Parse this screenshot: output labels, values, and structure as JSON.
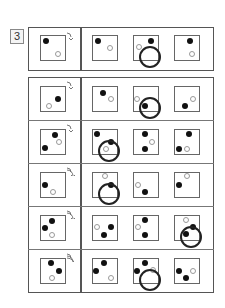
{
  "question_number": "3",
  "cell_size": 26,
  "example": {
    "rotation_arcs": 1,
    "given": {
      "dots": [
        {
          "x": 5,
          "y": 5,
          "type": "filled"
        },
        {
          "x": 17,
          "y": 18,
          "type": "hollow"
        }
      ]
    },
    "options": [
      {
        "dots": [
          {
            "x": 5,
            "y": 5,
            "type": "filled"
          },
          {
            "x": 17,
            "y": 12,
            "type": "hollow"
          }
        ],
        "circled": false
      },
      {
        "dots": [
          {
            "x": 17,
            "y": 5,
            "type": "filled"
          },
          {
            "x": 5,
            "y": 11,
            "type": "hollow"
          }
        ],
        "circled": true
      },
      {
        "dots": [
          {
            "x": 15,
            "y": 5,
            "type": "filled"
          },
          {
            "x": 17,
            "y": 18,
            "type": "hollow"
          }
        ],
        "circled": false
      }
    ]
  },
  "rows": [
    {
      "rotation_arcs": 1,
      "given": {
        "dots": [
          {
            "x": 17,
            "y": 12,
            "type": "filled"
          },
          {
            "x": 8,
            "y": 19,
            "type": "hollow"
          }
        ]
      },
      "options": [
        {
          "dots": [
            {
              "x": 10,
              "y": 6,
              "type": "filled"
            },
            {
              "x": 18,
              "y": 12,
              "type": "hollow"
            }
          ],
          "circled": false
        },
        {
          "dots": [
            {
              "x": 11,
              "y": 19,
              "type": "filled"
            },
            {
              "x": 3,
              "y": 12,
              "type": "hollow"
            }
          ],
          "circled": true
        },
        {
          "dots": [
            {
              "x": 10,
              "y": 19,
              "type": "filled"
            },
            {
              "x": 18,
              "y": 12,
              "type": "hollow"
            }
          ],
          "circled": false
        }
      ]
    },
    {
      "rotation_arcs": 1,
      "given": {
        "dots": [
          {
            "x": 14,
            "y": 5,
            "type": "filled"
          },
          {
            "x": 4,
            "y": 18,
            "type": "filled"
          },
          {
            "x": 18,
            "y": 12,
            "type": "hollow"
          }
        ]
      },
      "options": [
        {
          "dots": [
            {
              "x": 4,
              "y": 4,
              "type": "filled"
            },
            {
              "x": 18,
              "y": 12,
              "type": "filled"
            },
            {
              "x": 13,
              "y": 19,
              "type": "hollow"
            }
          ],
          "circled": true
        },
        {
          "dots": [
            {
              "x": 11,
              "y": 4,
              "type": "filled"
            },
            {
              "x": 11,
              "y": 19,
              "type": "filled"
            },
            {
              "x": 18,
              "y": 12,
              "type": "hollow"
            }
          ],
          "circled": false
        },
        {
          "dots": [
            {
              "x": 14,
              "y": 4,
              "type": "filled"
            },
            {
              "x": 4,
              "y": 19,
              "type": "filled"
            },
            {
              "x": 12,
              "y": 19,
              "type": "hollow"
            }
          ],
          "circled": false
        }
      ]
    },
    {
      "rotation_arcs": 2,
      "given": {
        "dots": [
          {
            "x": 4,
            "y": 12,
            "type": "filled"
          },
          {
            "x": 12,
            "y": 19,
            "type": "hollow"
          }
        ]
      },
      "options": [
        {
          "dots": [
            {
              "x": 18,
              "y": 12,
              "type": "filled"
            },
            {
              "x": 12,
              "y": 3,
              "type": "hollow"
            }
          ],
          "circled": true
        },
        {
          "dots": [
            {
              "x": 11,
              "y": 19,
              "type": "filled"
            },
            {
              "x": 4,
              "y": 12,
              "type": "hollow"
            }
          ],
          "circled": false
        },
        {
          "dots": [
            {
              "x": 4,
              "y": 12,
              "type": "filled"
            },
            {
              "x": 12,
              "y": 3,
              "type": "hollow"
            }
          ],
          "circled": false
        }
      ]
    },
    {
      "rotation_arcs": 2,
      "given": {
        "dots": [
          {
            "x": 11,
            "y": 5,
            "type": "filled"
          },
          {
            "x": 4,
            "y": 12,
            "type": "filled"
          },
          {
            "x": 11,
            "y": 19,
            "type": "hollow"
          }
        ]
      },
      "options": [
        {
          "dots": [
            {
              "x": 18,
              "y": 11,
              "type": "filled"
            },
            {
              "x": 11,
              "y": 19,
              "type": "filled"
            },
            {
              "x": 4,
              "y": 11,
              "type": "hollow"
            }
          ],
          "circled": false
        },
        {
          "dots": [
            {
              "x": 11,
              "y": 4,
              "type": "filled"
            },
            {
              "x": 11,
              "y": 19,
              "type": "filled"
            },
            {
              "x": 4,
              "y": 11,
              "type": "hollow"
            }
          ],
          "circled": false
        },
        {
          "dots": [
            {
              "x": 18,
              "y": 11,
              "type": "filled"
            },
            {
              "x": 11,
              "y": 18,
              "type": "filled"
            },
            {
              "x": 11,
              "y": 4,
              "type": "hollow"
            }
          ],
          "circled": true
        }
      ]
    },
    {
      "rotation_arcs": 3,
      "given": {
        "dots": [
          {
            "x": 10,
            "y": 4,
            "type": "filled"
          },
          {
            "x": 18,
            "y": 12,
            "type": "filled"
          },
          {
            "x": 11,
            "y": 19,
            "type": "hollow"
          }
        ]
      },
      "options": [
        {
          "dots": [
            {
              "x": 11,
              "y": 4,
              "type": "filled"
            },
            {
              "x": 3,
              "y": 12,
              "type": "filled"
            },
            {
              "x": 18,
              "y": 19,
              "type": "hollow"
            }
          ],
          "circled": false
        },
        {
          "dots": [
            {
              "x": 11,
              "y": 4,
              "type": "filled"
            },
            {
              "x": 3,
              "y": 12,
              "type": "filled"
            },
            {
              "x": 19,
              "y": 11,
              "type": "hollow"
            }
          ],
          "circled": true
        },
        {
          "dots": [
            {
              "x": 4,
              "y": 12,
              "type": "filled"
            },
            {
              "x": 11,
              "y": 19,
              "type": "filled"
            },
            {
              "x": 18,
              "y": 12,
              "type": "hollow"
            }
          ],
          "circled": false
        }
      ]
    }
  ]
}
